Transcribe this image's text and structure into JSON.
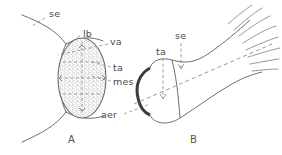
{
  "figure": {
    "type": "line-drawing",
    "background_color": "#ffffff",
    "ink_color": "#6b6b6b",
    "label_color": "#4a4a4a"
  },
  "panels": [
    {
      "id": "A",
      "label": "A",
      "x": 68,
      "y": 140
    },
    {
      "id": "B",
      "label": "B",
      "x": 190,
      "y": 140
    }
  ],
  "labels": [
    {
      "id": "se-a",
      "text": "se",
      "x": 49,
      "y": 13,
      "panel": "A"
    },
    {
      "id": "lb",
      "text": "lb",
      "x": 83,
      "y": 37,
      "panel": "A"
    },
    {
      "id": "va",
      "text": "va",
      "x": 110,
      "y": 45,
      "panel": "A"
    },
    {
      "id": "ta-a",
      "text": "ta",
      "x": 113,
      "y": 69,
      "panel": "A"
    },
    {
      "id": "mes",
      "text": "mes",
      "x": 113,
      "y": 83,
      "panel": "A"
    },
    {
      "id": "aer",
      "text": "aer",
      "x": 106,
      "y": 117,
      "panel": "A"
    },
    {
      "id": "ta-b",
      "text": "ta",
      "x": 157,
      "y": 54,
      "panel": "B"
    },
    {
      "id": "se-b",
      "text": "se",
      "x": 176,
      "y": 38,
      "panel": "B"
    }
  ]
}
